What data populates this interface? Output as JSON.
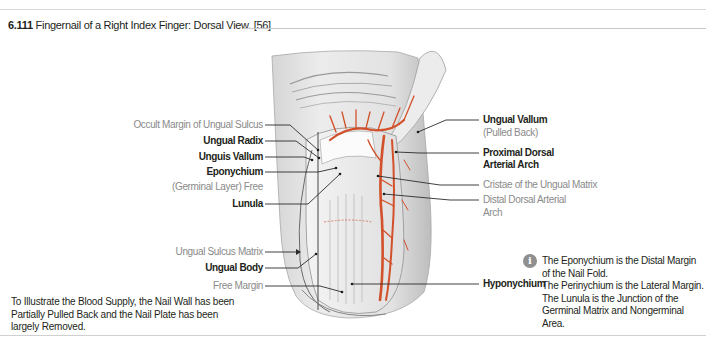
{
  "figure": {
    "number": "6.111",
    "title": "Fingernail of a Right Index Finger: Dorsal View. [56]"
  },
  "labels_left": [
    {
      "id": "occult-margin",
      "text": "Occult Margin of Ungual Sulcus",
      "style": "gray"
    },
    {
      "id": "ungual-radix",
      "text": "Ungual Radix",
      "style": "bold"
    },
    {
      "id": "unguis-vallum",
      "text": "Unguis Vallum",
      "style": "bold"
    },
    {
      "id": "eponychium",
      "text": "Eponychium",
      "style": "bold"
    },
    {
      "id": "germinal-layer",
      "text": "(Germinal Layer) Free",
      "style": "gray"
    },
    {
      "id": "lunula",
      "text": "Lunula",
      "style": "bold"
    },
    {
      "id": "ungual-sulcus-matrix",
      "text": "Ungual Sulcus Matrix",
      "style": "gray"
    },
    {
      "id": "ungual-body",
      "text": "Ungual Body",
      "style": "bold"
    },
    {
      "id": "free-margin",
      "text": "Free Margin",
      "style": "gray"
    }
  ],
  "labels_right": [
    {
      "id": "ungual-vallum",
      "text": "Ungual Vallum",
      "style": "bold"
    },
    {
      "id": "pulled-back",
      "text": "(Pulled Back)",
      "style": "gray"
    },
    {
      "id": "proximal-dorsal-1",
      "text": "Proximal Dorsal",
      "style": "bold"
    },
    {
      "id": "proximal-dorsal-2",
      "text": "Arterial Arch",
      "style": "bold"
    },
    {
      "id": "cristae",
      "text": "Cristae of the Ungual Matrix",
      "style": "gray"
    },
    {
      "id": "distal-dorsal-1",
      "text": "Distal Dorsal Arterial",
      "style": "gray"
    },
    {
      "id": "distal-dorsal-2",
      "text": "Arch",
      "style": "gray"
    },
    {
      "id": "hyponychium",
      "text": "Hyponychium",
      "style": "bold"
    }
  ],
  "caption": "To Illustrate the Blood Supply, the Nail Wall has been Partially Pulled Back and the Nail Plate has been largely Removed.",
  "note": {
    "icon": "info-icon",
    "icon_glyph": "i",
    "lines": [
      "The Eponychium is the Distal Margin of the Nail Fold.",
      "The Perinychium is the Lateral Margin.",
      "The Lunula is the Junction of the Germinal Matrix and Nongerminal Area."
    ]
  },
  "colors": {
    "artery": "#d2502a",
    "skin_shadow": "#b9b9b9",
    "leader_line": "#2b2b2b",
    "gray_text": "#8a8a8a"
  }
}
